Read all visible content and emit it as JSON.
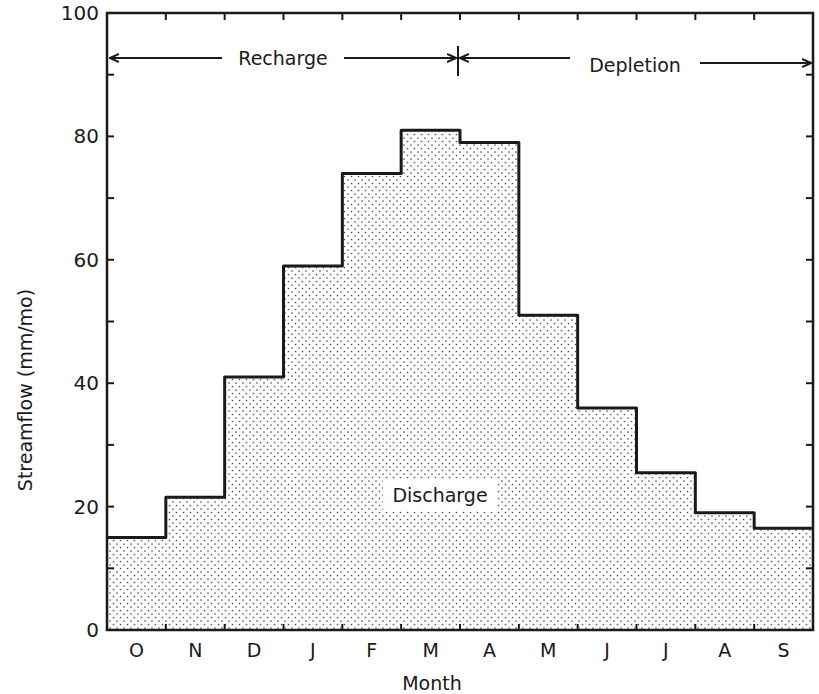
{
  "chart_data": {
    "type": "bar",
    "style": "step-histogram",
    "title": "",
    "xlabel": "Month",
    "ylabel": "Streamflow (mm/mo)",
    "categories": [
      "O",
      "N",
      "D",
      "J",
      "F",
      "M",
      "A",
      "M",
      "J",
      "J",
      "A",
      "S"
    ],
    "values": [
      15,
      21.5,
      41,
      59,
      74,
      81,
      79,
      51,
      36,
      25.5,
      19,
      16.5
    ],
    "ylim": [
      0,
      100
    ],
    "yticks": [
      0,
      20,
      40,
      60,
      80,
      100
    ],
    "grid": false,
    "legend": null,
    "fill": "stippled (dot pattern)",
    "annotations": [
      {
        "text": "Recharge",
        "type": "span-arrow",
        "from": "O",
        "to": "mid M/A",
        "y": 93
      },
      {
        "text": "Depletion",
        "type": "span-arrow",
        "from": "mid M/A",
        "to": "S",
        "y": 93
      },
      {
        "text": "Discharge",
        "type": "area-label",
        "x": "F-M",
        "y": 21
      }
    ]
  },
  "labels": {
    "ylabel": "Streamflow (mm/mo)",
    "xlabel": "Month",
    "recharge": "Recharge",
    "depletion": "Depletion",
    "discharge": "Discharge"
  },
  "colors": {
    "ink": "#1a1a1a",
    "background": "#ffffff",
    "dot": "#555555"
  }
}
